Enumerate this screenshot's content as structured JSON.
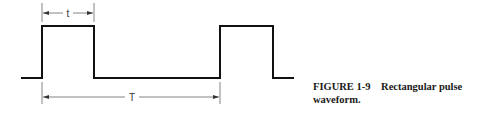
{
  "figure": {
    "label": "FIGURE 1-9",
    "title": "Rectangular pulse waveform."
  },
  "diagram": {
    "type": "rectangular-pulse-waveform",
    "pulse_width_label": "t",
    "period_label": "T",
    "colors": {
      "waveform": "#111111",
      "dimension": "#555555"
    }
  }
}
